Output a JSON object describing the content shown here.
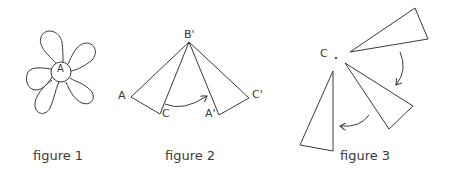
{
  "figures": [
    {
      "caption": "figure 1",
      "description": "flower with five petals around a central circle",
      "labels": {
        "center": "A"
      }
    },
    {
      "caption": "figure 2",
      "description": "triangle ABC rotated about B' to A'B'C'",
      "labels": {
        "top": "B'",
        "left": "A",
        "c": "C",
        "a_prime": "A'",
        "c_prime": "C'"
      }
    },
    {
      "caption": "figure 3",
      "description": "triangle rotated about point C, three positions with curved arrows",
      "labels": {
        "center": "C"
      }
    }
  ],
  "colors": {
    "stroke": "#3a3a3a",
    "background": "#ffffff"
  }
}
